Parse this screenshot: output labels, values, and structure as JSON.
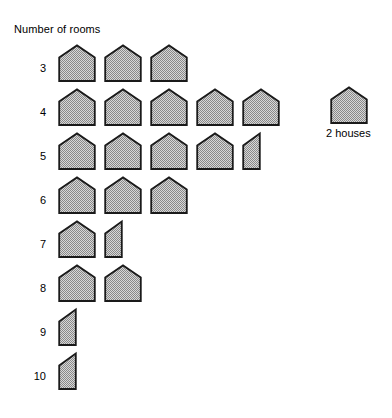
{
  "chart": {
    "title": "Number of rooms",
    "row_label_name": "rooms"
  },
  "legend": {
    "label": "2 houses",
    "symbol": "house-icon",
    "unit_value": 2
  },
  "style": {
    "symbol_fill": "#a8a8a8",
    "symbol_stroke": "#1a1a1a",
    "background": "#ffffff",
    "text_color": "#000000"
  },
  "rows": [
    {
      "label": "3",
      "full": 3,
      "half": 0
    },
    {
      "label": "4",
      "full": 5,
      "half": 0
    },
    {
      "label": "5",
      "full": 4,
      "half": 1
    },
    {
      "label": "6",
      "full": 3,
      "half": 0
    },
    {
      "label": "7",
      "full": 1,
      "half": 1
    },
    {
      "label": "8",
      "full": 2,
      "half": 0
    },
    {
      "label": "9",
      "full": 0,
      "half": 1
    },
    {
      "label": "10",
      "full": 0,
      "half": 1
    }
  ],
  "chart_data": {
    "type": "bar",
    "title": "Number of rooms",
    "xlabel": "Number of houses",
    "ylabel": "Number of rooms",
    "categories": [
      "3",
      "4",
      "5",
      "6",
      "7",
      "8",
      "9",
      "10"
    ],
    "values": [
      6,
      10,
      9,
      6,
      3,
      4,
      1,
      1
    ],
    "symbols": [
      3,
      5,
      4.5,
      3,
      1.5,
      2,
      0.5,
      0.5
    ],
    "unit_label": "2 houses",
    "unit_value": 2,
    "orientation": "horizontal",
    "grid": false,
    "legend_position": "right",
    "xlim": [
      0,
      10
    ]
  }
}
